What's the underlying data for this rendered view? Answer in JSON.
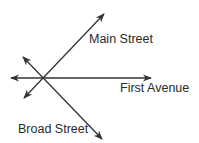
{
  "diagram": {
    "type": "intersecting-lines",
    "stroke_color": "#333333",
    "text_color": "#2a2a2a",
    "intersection": {
      "x": 42,
      "y": 78
    },
    "streets": [
      {
        "name": "Main Street",
        "from": {
          "x": 24,
          "y": 98
        },
        "to": {
          "x": 104,
          "y": 14
        },
        "arrows": "both",
        "label_pos": {
          "x": 89,
          "y": 43
        }
      },
      {
        "name": "First Avenue",
        "from": {
          "x": 11,
          "y": 78
        },
        "to": {
          "x": 151,
          "y": 78
        },
        "arrows": "both",
        "label_pos": {
          "x": 120,
          "y": 92
        }
      },
      {
        "name": "Broad Street",
        "from": {
          "x": 23,
          "y": 57
        },
        "to": {
          "x": 102,
          "y": 139
        },
        "arrows": "both",
        "label_pos": {
          "x": 18,
          "y": 133
        }
      }
    ]
  },
  "labels": {
    "main_street": "Main Street",
    "first_avenue": "First Avenue",
    "broad_street": "Broad Street"
  }
}
